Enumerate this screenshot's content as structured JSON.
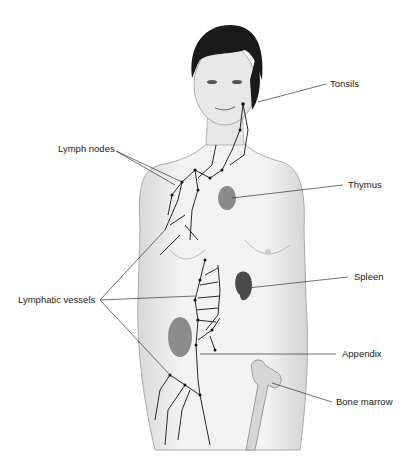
{
  "figure": {
    "labels": {
      "tonsils": "Tonsils",
      "lymph_nodes": "Lymph nodes",
      "thymus": "Thymus",
      "spleen": "Spleen",
      "lymphatic_vessels": "Lymphatic vessels",
      "appendix": "Appendix",
      "bone_marrow": "Bone marrow"
    }
  }
}
